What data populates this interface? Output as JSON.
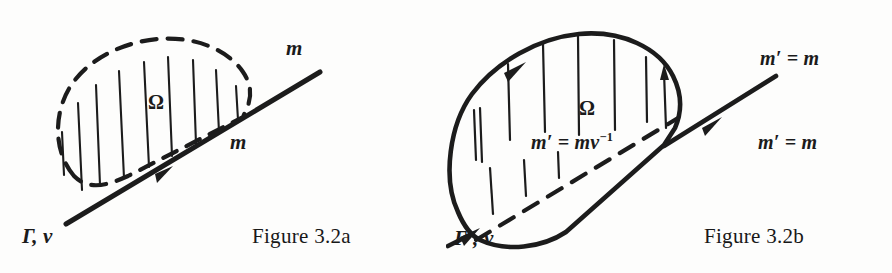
{
  "page": {
    "background_color": "#fdfdfc",
    "ink_color": "#1c1c1c",
    "width": 892,
    "height": 273
  },
  "figures": [
    {
      "id": "figure-3-2a",
      "caption": "Figure 3.2a",
      "region_label": "Ω",
      "curve_style": "dashed",
      "line_style": "solid",
      "labels": {
        "m_top": "m",
        "m_bottom": "m",
        "boundary": "Γ, v"
      }
    },
    {
      "id": "figure-3-2b",
      "caption": "Figure 3.2b",
      "region_label": "Ω",
      "curve_style": "solid",
      "line_style": "dashed",
      "labels": {
        "m_top": "m′ = m",
        "m_bottom": "m′ = m",
        "m_inner_base": "m′ = mv",
        "m_inner_exp": "−1",
        "boundary": "Γ′, v"
      }
    }
  ]
}
